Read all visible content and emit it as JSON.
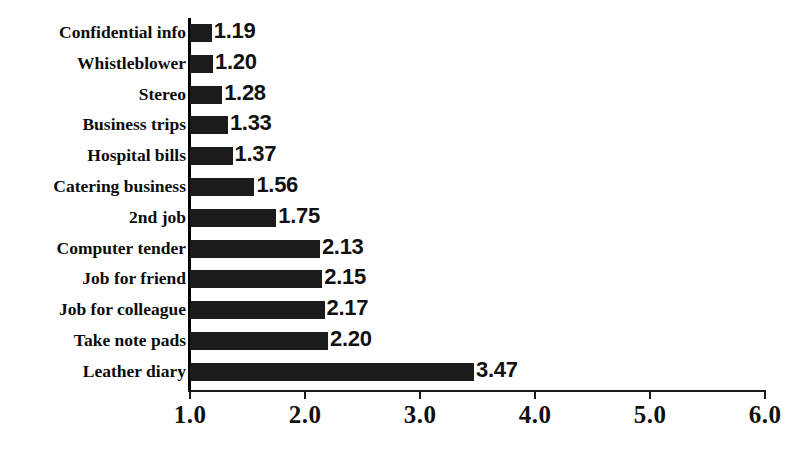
{
  "chart_data": {
    "type": "bar",
    "orientation": "horizontal",
    "title": "",
    "subtitle": "",
    "xlabel": "",
    "ylabel": "",
    "xlim": [
      1.0,
      6.0
    ],
    "xticks": [
      "1.0",
      "2.0",
      "3.0",
      "4.0",
      "5.0",
      "6.0"
    ],
    "xtick_values": [
      1.0,
      2.0,
      3.0,
      4.0,
      5.0,
      6.0
    ],
    "grid": false,
    "legend": null,
    "bar_color": "#1b1b1b",
    "baseline": 1.0,
    "categories": [
      "Confidential info",
      "Whistleblower",
      "Stereo",
      "Business trips",
      "Hospital bills",
      "Catering business",
      "2nd job",
      "Computer tender",
      "Job for friend",
      "Job for colleague",
      "Take note pads",
      "Leather diary"
    ],
    "values": [
      1.19,
      1.2,
      1.28,
      1.33,
      1.37,
      1.56,
      1.75,
      2.13,
      2.15,
      2.17,
      2.2,
      3.47
    ],
    "value_labels": [
      "1.19",
      "1.20",
      "1.28",
      "1.33",
      "1.37",
      "1.56",
      "1.75",
      "2.13",
      "2.15",
      "2.17",
      "2.20",
      "3.47"
    ]
  }
}
